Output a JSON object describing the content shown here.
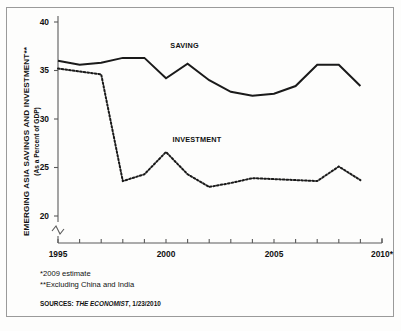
{
  "chart_data": {
    "type": "line",
    "title": "",
    "ylabel": "EMERGING ASIA SAVINGS AND INVESTMENT**",
    "ylabel_sub": "(As a Percent of GDP)",
    "xlabel": "",
    "ylim": [
      20,
      40
    ],
    "xlim": [
      1995,
      2010
    ],
    "yticks": [
      20,
      25,
      30,
      35,
      40
    ],
    "ytick_labels": [
      "20",
      "25",
      "30",
      "35",
      "40"
    ],
    "xticks": [
      1995,
      1996,
      1997,
      1998,
      1999,
      2000,
      2001,
      2002,
      2003,
      2004,
      2005,
      2006,
      2007,
      2008,
      2009,
      2010
    ],
    "xtick_labels": [
      "1995",
      "2000",
      "2005",
      "2010*"
    ],
    "xtick_label_years": [
      1995,
      2000,
      2005,
      2010
    ],
    "axis_break": true,
    "axis_break_note": "y-axis broken below 20",
    "grid": false,
    "legend_position": "inline-annotations",
    "x": [
      1995,
      1996,
      1997,
      1998,
      1999,
      2000,
      2001,
      2002,
      2003,
      2004,
      2005,
      2006,
      2007,
      2008,
      2009
    ],
    "series": [
      {
        "name": "SAVING",
        "style": "solid",
        "color": "#1a1a1a",
        "label_x": 2000.2,
        "label_y": 37.6,
        "values": [
          36.0,
          35.6,
          35.8,
          36.3,
          36.3,
          34.2,
          35.7,
          34.0,
          32.8,
          32.4,
          32.6,
          33.4,
          35.6,
          35.6,
          33.4
        ]
      },
      {
        "name": "INVESTMENT",
        "style": "dashed",
        "color": "#1a1a1a",
        "label_x": 2000.3,
        "label_y": 27.9,
        "values": [
          35.2,
          34.9,
          34.6,
          23.6,
          24.3,
          26.6,
          24.3,
          23.0,
          23.4,
          23.9,
          23.8,
          23.7,
          23.6,
          25.1,
          23.7
        ]
      }
    ]
  },
  "footnotes": {
    "estimate_mark": "*",
    "estimate_text": "2009 estimate",
    "exclusion_mark": "**",
    "exclusion_text": "Excluding China and India"
  },
  "source": {
    "prefix": "SOURCES:",
    "publication": "THE ECONOMIST",
    "date": ", 1/23/2010"
  }
}
